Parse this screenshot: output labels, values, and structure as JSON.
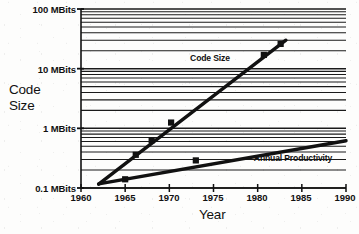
{
  "chart_data": {
    "type": "line",
    "title": "",
    "xlabel": "Year",
    "ylabel": "Code Size",
    "ylabel_lines": [
      "Code",
      "Size"
    ],
    "xlim": [
      1960,
      1990
    ],
    "ylim": [
      0.1,
      100
    ],
    "yscale": "log",
    "xscale": "linear",
    "yunit": "MBits",
    "grid": "horizontal-log-minor",
    "legend": "inline-annotation",
    "xticks": [
      1960,
      1965,
      1970,
      1975,
      1980,
      1985,
      1990
    ],
    "xticklabels": [
      "1960",
      "1965",
      "1970",
      "1975",
      "1980",
      "1985",
      "1990"
    ],
    "yticks": [
      0.1,
      1,
      10,
      100
    ],
    "yticklabels": [
      "0.1 MBits",
      "1 MBits",
      "10 MBits",
      "100 MBits"
    ],
    "series": [
      {
        "name": "Code Size",
        "marker": "filled-square",
        "line": "solid-thick",
        "points": [
          {
            "x": 1965.0,
            "y": 0.14
          },
          {
            "x": 1966.2,
            "y": 0.36
          },
          {
            "x": 1968.0,
            "y": 0.63
          },
          {
            "x": 1970.2,
            "y": 1.25
          },
          {
            "x": 1980.7,
            "y": 17.0
          },
          {
            "x": 1982.6,
            "y": 26.0
          }
        ],
        "trend": [
          {
            "x": 1962.0,
            "y": 0.116
          },
          {
            "x": 1983.2,
            "y": 30.0
          }
        ]
      },
      {
        "name": "Annual Productivity",
        "marker": "filled-square",
        "line": "solid-thick",
        "points": [
          {
            "x": 1973.0,
            "y": 0.29
          }
        ],
        "trend": [
          {
            "x": 1962.0,
            "y": 0.117
          },
          {
            "x": 1990.0,
            "y": 0.62
          }
        ]
      }
    ],
    "annotations": [
      {
        "text": "Code Size",
        "x": 1974.6,
        "y": 13.5
      },
      {
        "text": "Annual Productivity",
        "x": 1984.0,
        "y": 0.285
      }
    ]
  },
  "colors": {
    "ink": "#111111",
    "grid": "#1a1a1a",
    "background": "#fdfdfc"
  }
}
